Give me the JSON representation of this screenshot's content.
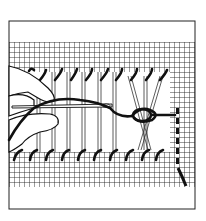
{
  "illustration": {
    "subject": "hemstitch needlework on drawn-thread fabric",
    "colors": {
      "ink": "#111111",
      "paper": "#ffffff",
      "grid": "#222222"
    },
    "frame": {
      "x": 9,
      "y": 21,
      "width": 186,
      "height": 188
    },
    "grid": {
      "top": 42,
      "bottom": 187,
      "left": 9,
      "right": 195,
      "spacing": 5
    },
    "drawn_band": {
      "top": 70,
      "bottom": 152,
      "left": 9,
      "right": 170
    },
    "elements": [
      "hand",
      "needle",
      "thread",
      "grouped-threads",
      "stitches-top",
      "stitches-bottom",
      "running-stitch-edge"
    ]
  }
}
